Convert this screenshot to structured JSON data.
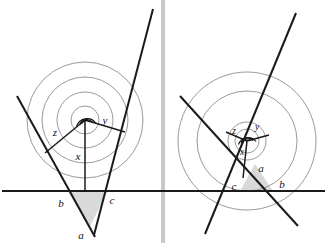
{
  "figure": {
    "colors": {
      "ink": "#111111",
      "ray": "#1a1a1a",
      "circle": "#8d8d96",
      "shade": "#d9d9d9",
      "divider": "#c9c9c9",
      "background": "#ffffff"
    },
    "divider": {
      "name": "vertical-divider",
      "x": 163,
      "width": 4,
      "color": "#c9c9c9"
    },
    "baseline": {
      "name": "horizontal-baseline",
      "y": 191,
      "x1": 2,
      "x2": 325
    }
  },
  "panels": [
    {
      "id": "left",
      "name": "left-diagram",
      "vertex": {
        "x": 85,
        "y": 120
      },
      "circles": [
        {
          "r": 14
        },
        {
          "r": 28
        },
        {
          "r": 43
        },
        {
          "r": 58
        }
      ],
      "angle_labels": [
        {
          "key": "z",
          "text": "z",
          "x": 58,
          "y": 133
        },
        {
          "key": "y",
          "text": "y",
          "x": 105,
          "y": 122
        },
        {
          "key": "x",
          "text": "x",
          "x": 79,
          "y": 158
        }
      ],
      "point_labels": [
        {
          "key": "b",
          "text": "b",
          "x": 62,
          "y": 206
        },
        {
          "key": "c",
          "text": "c",
          "x": 111,
          "y": 203
        },
        {
          "key": "a",
          "text": "a",
          "x": 81,
          "y": 238
        }
      ],
      "rays": [
        {
          "name": "ray-z",
          "x1": 85,
          "y1": 120,
          "x2": 45,
          "y2": 153
        },
        {
          "name": "ray-y",
          "x1": 85,
          "y1": 120,
          "x2": 125,
          "y2": 132
        },
        {
          "name": "ray-x",
          "x1": 85,
          "y1": 120,
          "x2": 85,
          "y2": 191
        }
      ],
      "lines": [
        {
          "name": "line-left-oblique",
          "x1": 17,
          "y1": 96,
          "x2": 95,
          "y2": 237
        },
        {
          "name": "line-right-oblique",
          "x1": 153,
          "y1": 9,
          "x2": 94,
          "y2": 235
        }
      ],
      "triangle": {
        "name": "shaded-triangle",
        "points": "68,191 108,191 89,228"
      }
    },
    {
      "id": "right",
      "name": "right-diagram",
      "vertex": {
        "x": 247,
        "y": 141
      },
      "circles": [
        {
          "r": 12
        },
        {
          "r": 19
        },
        {
          "r": 50
        },
        {
          "r": 69
        }
      ],
      "angle_labels": [
        {
          "key": "z",
          "text": "z",
          "x": 233,
          "y": 131
        },
        {
          "key": "y",
          "text": "y",
          "x": 256,
          "y": 127
        },
        {
          "key": "x",
          "text": "x",
          "x": 243,
          "y": 152
        }
      ],
      "point_labels": [
        {
          "key": "a",
          "text": "a",
          "x": 259,
          "y": 169
        },
        {
          "key": "c",
          "text": "c",
          "x": 235,
          "y": 189
        },
        {
          "key": "b",
          "text": "b",
          "x": 281,
          "y": 187
        }
      ],
      "rays": [
        {
          "name": "ray-z",
          "x1": 247,
          "y1": 141,
          "x2": 228,
          "y2": 133
        },
        {
          "name": "ray-y",
          "x1": 247,
          "y1": 141,
          "x2": 268,
          "y2": 135
        },
        {
          "name": "ray-x",
          "x1": 247,
          "y1": 141,
          "x2": 243,
          "y2": 176
        }
      ],
      "lines": [
        {
          "name": "line-left-oblique",
          "x1": 180,
          "y1": 96,
          "x2": 298,
          "y2": 226
        },
        {
          "name": "line-right-oblique",
          "x1": 296,
          "y1": 13,
          "x2": 205,
          "y2": 234
        }
      ],
      "triangle": {
        "name": "shaded-triangle",
        "points": "240,191 273,191 255,164"
      }
    }
  ]
}
